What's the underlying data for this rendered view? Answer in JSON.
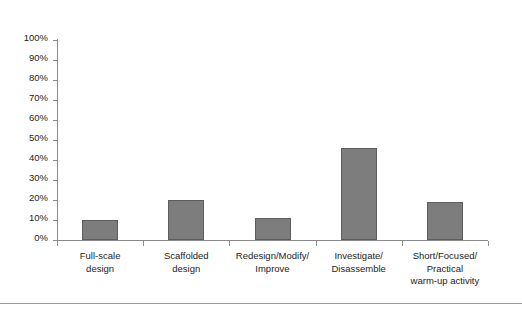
{
  "chart_data": {
    "type": "bar",
    "title": "",
    "subtitle": "",
    "xlabel": "",
    "ylabel": "",
    "ylim": [
      0,
      100
    ],
    "grid": false,
    "legend": null,
    "y_tick_labels": [
      "100%",
      "90%",
      "80%",
      "70%",
      "60%",
      "50%",
      "40%",
      "30%",
      "20%",
      "10%",
      "0%"
    ],
    "y_tick_values": [
      100,
      90,
      80,
      70,
      60,
      50,
      40,
      30,
      20,
      10,
      0
    ],
    "categories": [
      "Full-scale\ndesign",
      "Scaffolded\ndesign",
      "Redesign/Modify/\nImprove",
      "Investigate/\nDisassemble",
      "Short/Focused/\nPractical\nwarm-up activity"
    ],
    "values": [
      10,
      20,
      11,
      46,
      19
    ],
    "value_unit": "%",
    "bar_color": "#7d7d7d",
    "bar_border_color": "#5d5d5d",
    "axis_color": "#8a8a8a",
    "text_color": "#1c1c1c",
    "background_color": "#ffffff"
  }
}
